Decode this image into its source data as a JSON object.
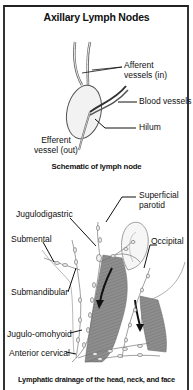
{
  "title": "Axillary Lymph Nodes",
  "schematic": {
    "caption": "Schematic of lymph node",
    "labels": {
      "afferent_line1": "Afferent",
      "afferent_line2": "vessels (in)",
      "blood_vessels": "Blood vessels",
      "hilum": "Hilum",
      "efferent_line1": "Efferent",
      "efferent_line2": "vessel (out)"
    }
  },
  "head_neck": {
    "caption": "Lymphatic drainage of the head, neck, and face",
    "labels": {
      "superficial_parotid_line1": "Superficial",
      "superficial_parotid_line2": "parotid",
      "jugulodigastric": "Jugulodigastric",
      "occipital": "Occipital",
      "submental": "Submental",
      "submandibular": "Submandibular",
      "jugulo_omohyoid": "Jugulo-omohyoid",
      "anterior_cervical": "Anterior cervical"
    }
  },
  "colors": {
    "border": "#222222",
    "muscle": "#8a8a8a",
    "node_fill": "#f2f2f2",
    "text": "#111111"
  }
}
